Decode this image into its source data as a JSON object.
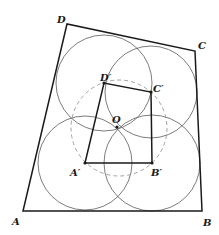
{
  "diagram": {
    "title": "",
    "outer_quadrilateral": {
      "name": "ABCD",
      "vertices": {
        "A": {
          "x": 23,
          "y": 211,
          "label": "A",
          "label_x": 12,
          "label_y": 225
        },
        "B": {
          "x": 202,
          "y": 211,
          "label": "B",
          "label_x": 203,
          "label_y": 226
        },
        "C": {
          "x": 195,
          "y": 51,
          "label": "C",
          "label_x": 198,
          "label_y": 49
        },
        "D": {
          "x": 67,
          "y": 24,
          "label": "D",
          "label_x": 57,
          "label_y": 23
        }
      }
    },
    "inner_quadrilateral": {
      "name": "A'B'C'D'",
      "vertices": {
        "A_prime": {
          "x": 85,
          "y": 163,
          "label": "A′",
          "label_x": 70,
          "label_y": 176
        },
        "B_prime": {
          "x": 152,
          "y": 163,
          "label": "B′",
          "label_x": 151,
          "label_y": 176
        },
        "C_prime": {
          "x": 151,
          "y": 92,
          "label": "C′",
          "label_x": 153,
          "label_y": 92
        },
        "D_prime": {
          "x": 104,
          "y": 83,
          "label": "D′",
          "label_x": 100,
          "label_y": 81
        }
      }
    },
    "center_point": {
      "x": 117,
      "y": 127,
      "label": "O",
      "label_x": 112,
      "label_y": 123
    },
    "circles_solid": [
      {
        "name": "circle-A-prime",
        "cx": 85,
        "cy": 163,
        "r": 47
      },
      {
        "name": "circle-B-prime",
        "cx": 152,
        "cy": 163,
        "r": 48
      },
      {
        "name": "circle-C-prime",
        "cx": 151,
        "cy": 92,
        "r": 46
      },
      {
        "name": "circle-D-prime",
        "cx": 104,
        "cy": 83,
        "r": 48
      }
    ],
    "circle_dashed": {
      "name": "circle-O",
      "cx": 119,
      "cy": 128,
      "r": 48
    },
    "colors": {
      "line": "#1a1a1a",
      "circle": "#5a5a5a",
      "dashed_circle": "#8a8a8a",
      "background": "#ffffff"
    }
  }
}
